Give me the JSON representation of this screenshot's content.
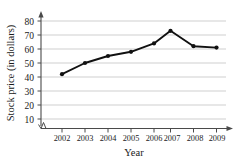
{
  "chart_data": {
    "type": "line",
    "title": "",
    "xlabel": "Year",
    "ylabel": "Stock price (in dollars)",
    "categories": [
      "2002",
      "2003",
      "2004",
      "2005",
      "2006",
      "2007",
      "2008",
      "2009"
    ],
    "values": [
      42,
      50,
      55,
      58,
      64,
      73,
      62,
      61
    ],
    "series": [
      {
        "name": "Stock price",
        "values": [
          42,
          50,
          55,
          58,
          64,
          73,
          62,
          61
        ]
      }
    ],
    "ylim": [
      0,
      85
    ],
    "y_ticks": [
      "10",
      "20",
      "30",
      "40",
      "50",
      "60",
      "70",
      "80"
    ],
    "y_tick_values": [
      10,
      20,
      30,
      40,
      50,
      60,
      70,
      80
    ],
    "grid": true,
    "grid_axis": "y",
    "legend": false,
    "legend_position": "none",
    "axis_break": true,
    "axis_arrows": true,
    "marker": "filled-circle",
    "line_color": "#111111",
    "grid_color": "#c9c9c9",
    "axis_color": "#4a4a4a",
    "background_color": "#ffffff"
  },
  "annotations": {
    "y_axis_break_symbol": "zigzag"
  }
}
